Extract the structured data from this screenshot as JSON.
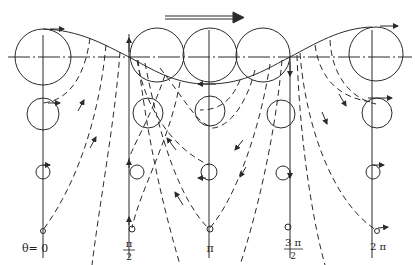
{
  "diagram": {
    "type": "orbital-motion-trajectory",
    "direction_arrow": "right",
    "colors": {
      "stroke": "#2a2a2a",
      "background": "#ffffff"
    },
    "stations": [
      {
        "x": 43,
        "label": "θ= 0",
        "label_type": "text"
      },
      {
        "x": 129,
        "label_num": "π",
        "label_den": "2",
        "label_type": "fraction"
      },
      {
        "x": 209,
        "label": "π",
        "label_type": "text"
      },
      {
        "x": 290,
        "label_num": "3 π",
        "label_den": "2",
        "label_type": "fraction"
      },
      {
        "x": 372,
        "label": "2 π",
        "label_type": "text"
      }
    ]
  },
  "labels": {
    "theta0": "θ= 0",
    "half_pi_num": "π",
    "half_pi_den": "2",
    "pi": "π",
    "three_half_pi_num": "3 π",
    "three_half_pi_den": "2",
    "two_pi": "2 π"
  }
}
